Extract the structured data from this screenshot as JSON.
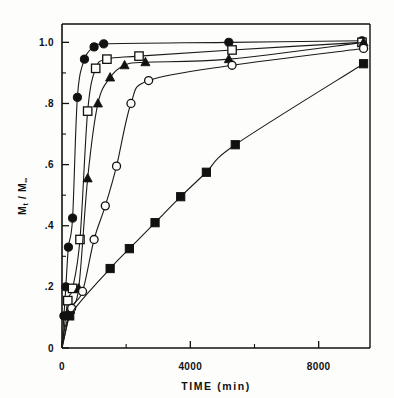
{
  "figure": {
    "background": "#fdfdfb",
    "ink": "#111111"
  },
  "chart_data": {
    "type": "line",
    "title": "",
    "xlabel": "TIME  (min)",
    "ylabel": "Mt/M∞",
    "ylabel_parts": {
      "m": "M",
      "sub_t": "t",
      "slash": "/",
      "m2": "M",
      "sub_inf": "∞"
    },
    "xlim": [
      0,
      9600
    ],
    "ylim": [
      0,
      1.06
    ],
    "grid": false,
    "legend": "none",
    "x_ticks_major": [
      0,
      4000,
      8000
    ],
    "x_tick_labels": [
      "0",
      "4000",
      "8000"
    ],
    "x_ticks_minor": [
      2000,
      6000
    ],
    "y_ticks_major": [
      0,
      0.2,
      0.4,
      0.6,
      0.8,
      1.0
    ],
    "y_tick_labels": [
      "0",
      ".2",
      ".4",
      ".6",
      ".8",
      "1.0"
    ],
    "y_ticks_minor": [
      0.1,
      0.3,
      0.5,
      0.7,
      0.9
    ],
    "series": [
      {
        "name": "series-filled-circle",
        "marker": "filled-circle",
        "x": [
          0,
          60,
          120,
          200,
          330,
          480,
          700,
          1000,
          1300,
          5200,
          9350
        ],
        "y": [
          0.0,
          0.105,
          0.2,
          0.33,
          0.425,
          0.82,
          0.945,
          0.985,
          0.995,
          1.0,
          1.005
        ]
      },
      {
        "name": "series-open-square",
        "marker": "open-square",
        "x": [
          0,
          180,
          330,
          560,
          800,
          1050,
          1400,
          2400,
          5300,
          9350
        ],
        "y": [
          0.0,
          0.155,
          0.195,
          0.355,
          0.775,
          0.915,
          0.945,
          0.955,
          0.975,
          1.0
        ]
      },
      {
        "name": "series-filled-triangle",
        "marker": "filled-triangle",
        "x": [
          0,
          260,
          520,
          800,
          1120,
          1500,
          1950,
          2600,
          5200,
          9400
        ],
        "y": [
          0.0,
          0.125,
          0.195,
          0.555,
          0.8,
          0.885,
          0.925,
          0.935,
          0.945,
          1.0
        ]
      },
      {
        "name": "series-open-circle",
        "marker": "open-circle",
        "x": [
          0,
          300,
          640,
          1000,
          1350,
          1700,
          2150,
          2700,
          5300,
          9400
        ],
        "y": [
          0.0,
          0.13,
          0.185,
          0.355,
          0.465,
          0.595,
          0.8,
          0.875,
          0.925,
          0.98
        ]
      },
      {
        "name": "series-filled-square",
        "marker": "filled-square",
        "x": [
          0,
          240,
          1500,
          2100,
          2900,
          3700,
          4500,
          5400,
          9400
        ],
        "y": [
          0.0,
          0.105,
          0.26,
          0.325,
          0.41,
          0.495,
          0.575,
          0.665,
          0.93
        ]
      }
    ]
  }
}
